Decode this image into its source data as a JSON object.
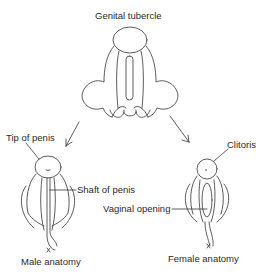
{
  "title": "Genital tubercle",
  "labels": {
    "genital_tubercle": "Genital tubercle",
    "tip_of_penis": "Tip of penis",
    "shaft_of_penis": "Shaft of penis",
    "clitoris": "Clitoris",
    "vaginal_opening": "Vaginal opening",
    "male_anatomy": "Male anatomy",
    "female_anatomy": "Female anatomy"
  },
  "arrows": [
    {
      "from": "genital-tubercle",
      "to": "male-anatomy"
    },
    {
      "from": "genital-tubercle",
      "to": "female-anatomy"
    }
  ],
  "colors": {
    "line": "#333333",
    "text": "#2a2a2a",
    "background": "#ffffff"
  }
}
